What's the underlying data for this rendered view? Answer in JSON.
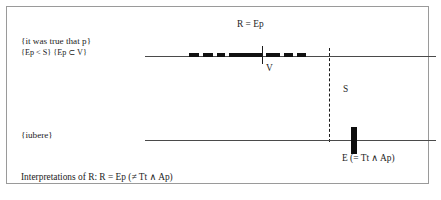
{
  "figure": {
    "title_note": "Interpretations of R diagram",
    "frame": {
      "border_color": "#9a9a9a"
    },
    "upper_track": {
      "left_labels": {
        "line1": "{it was true that p}",
        "line2": "{Ep < S} {Ep ⊂ V}"
      },
      "top_label": "R = Ep",
      "tick_label": "V",
      "axis": {
        "x_start": 138,
        "x_end": 429,
        "y": 49
      },
      "tick_r_x": 255,
      "interval_segments": [
        {
          "x": 188,
          "width": 10
        },
        {
          "x": 202,
          "width": 10
        },
        {
          "x": 216,
          "width": 8
        },
        {
          "x": 228,
          "width": 33
        },
        {
          "x": 265,
          "width": 14
        },
        {
          "x": 283,
          "width": 9
        },
        {
          "x": 296,
          "width": 9
        }
      ]
    },
    "separator": {
      "dashed_line_label": "S",
      "dashed_line_x": 322,
      "dashed_line_y_top": 41,
      "dashed_line_y_bottom": 135
    },
    "lower_track": {
      "left_label": "{iubere}",
      "axis": {
        "x_start": 138,
        "x_end": 429,
        "y": 133
      },
      "event_bar_x": 344,
      "event_label": "E (= Tt ∧ Ap)"
    },
    "footer": "Interpretations of R:  R = Ep (≠ Tt ∧ Ap)"
  },
  "colors": {
    "ink": "#1a1a1a",
    "axis": "#4a4a4a",
    "frame": "#9a9a9a",
    "mark": "#0d0d0d"
  }
}
